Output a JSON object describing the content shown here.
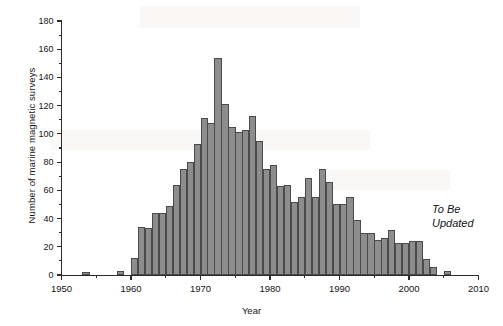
{
  "figure": {
    "annotation": "To Be\nUpdated",
    "annotation_style": "italic"
  },
  "colors": {
    "bar_fill": "#8d8d8d",
    "bar_stroke": "#4a4a4a",
    "axis": "#2b2b2b",
    "text": "#141414",
    "background": "#ffffff"
  },
  "chart_data": {
    "type": "bar",
    "title": "",
    "xlabel": "Year",
    "ylabel": "Number of marine magnetic surveys",
    "xlim": [
      1950,
      2010
    ],
    "ylim": [
      0,
      180
    ],
    "grid": false,
    "legend": null,
    "xticks": [
      1950,
      1960,
      1970,
      1980,
      1990,
      2000,
      2010
    ],
    "yticks": [
      0,
      20,
      40,
      60,
      80,
      100,
      120,
      140,
      160,
      180
    ],
    "ytick_minor_step": 10,
    "xtick_minor_step": 5,
    "categories": [
      1953,
      1958,
      1960,
      1961,
      1962,
      1963,
      1964,
      1965,
      1966,
      1967,
      1968,
      1969,
      1970,
      1971,
      1972,
      1973,
      1974,
      1975,
      1976,
      1977,
      1978,
      1979,
      1980,
      1981,
      1982,
      1983,
      1984,
      1985,
      1986,
      1987,
      1988,
      1989,
      1990,
      1991,
      1992,
      1993,
      1994,
      1995,
      1996,
      1997,
      1998,
      1999,
      2000,
      2001,
      2002,
      2003,
      2005
    ],
    "values": [
      2,
      3,
      12,
      34,
      33,
      44,
      44,
      49,
      64,
      75,
      80,
      93,
      111,
      108,
      154,
      121,
      105,
      101,
      103,
      113,
      95,
      75,
      78,
      63,
      64,
      52,
      55,
      69,
      55,
      75,
      66,
      50,
      50,
      55,
      39,
      30,
      30,
      25,
      26,
      32,
      23,
      23,
      24,
      24,
      11,
      6,
      3
    ]
  }
}
